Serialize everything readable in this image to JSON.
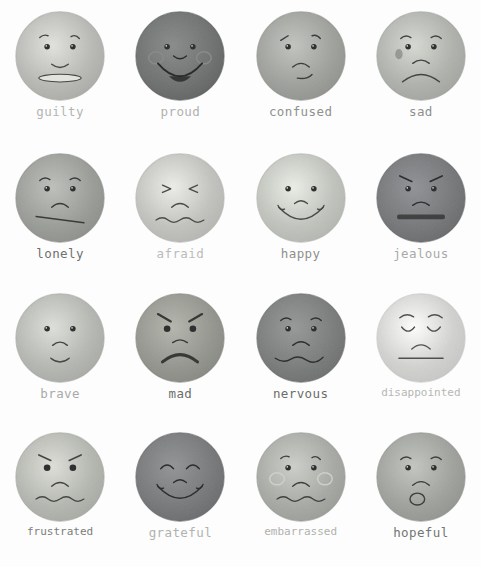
{
  "page": {
    "background": "#fdfdfd",
    "columns": 4,
    "rows": 4,
    "label_font_style": "typewriter",
    "palette_note": "grayscale watercolor washes"
  },
  "faces": [
    {
      "label": "guilty",
      "row": 1,
      "col": 1,
      "fill": "#b9bab6",
      "fill_edge": "#a7a8a4",
      "label_color": "#b4b5b2",
      "eyes": "open-dot",
      "brows": "one-raised-left",
      "mouth": "flat-oval-grimace",
      "cheeks": "none"
    },
    {
      "label": "proud",
      "row": 1,
      "col": 2,
      "fill": "#6f7271",
      "fill_edge": "#5d605f",
      "label_color": "#b0b1af",
      "eyes": "open-dot",
      "brows": "none",
      "mouth": "big-open-smile",
      "cheeks": "two-circles"
    },
    {
      "label": "confused",
      "row": 1,
      "col": 3,
      "fill": "#9fa19d",
      "fill_edge": "#8d8f8b",
      "label_color": "#8f918e",
      "eyes": "open-dot",
      "brows": "two-slanted",
      "mouth": "small-frown-offset",
      "cheeks": "none"
    },
    {
      "label": "sad",
      "row": 1,
      "col": 4,
      "fill": "#b0b2ad",
      "fill_edge": "#9fa19c",
      "label_color": "#8d8f8c",
      "eyes": "open-dot",
      "brows": "two-worried",
      "mouth": "big-frown",
      "cheeks": "left-tear-blotch"
    },
    {
      "label": "lonely",
      "row": 2,
      "col": 1,
      "fill": "#9b9d99",
      "fill_edge": "#8a8c88",
      "label_color": "#6e706d",
      "eyes": "open-dot",
      "brows": "two-worried",
      "mouth": "straight-slanted-line",
      "cheeks": "small-frown-above"
    },
    {
      "label": "afraid",
      "row": 2,
      "col": 2,
      "fill": "#c2c3bf",
      "fill_edge": "#b2b3af",
      "label_color": "#bbbcb9",
      "eyes": "squeezed-shut",
      "brows": "none",
      "mouth": "wavy-line-with-frown",
      "cheeks": "none"
    },
    {
      "label": "happy",
      "row": 2,
      "col": 3,
      "fill": "#c1c3bd",
      "fill_edge": "#b1b3ae",
      "label_color": "#8e908d",
      "eyes": "open-dot",
      "brows": "none",
      "mouth": "wide-smile-with-nose",
      "cheeks": "none"
    },
    {
      "label": "jealous",
      "row": 2,
      "col": 4,
      "fill": "#76787a",
      "fill_edge": "#656769",
      "label_color": "#a9aaa8",
      "eyes": "open-dot",
      "brows": "two-angry",
      "mouth": "flat-thick-bar",
      "cheeks": "small-frown-above"
    },
    {
      "label": "brave",
      "row": 3,
      "col": 1,
      "fill": "#b6b8b3",
      "fill_edge": "#a5a7a2",
      "label_color": "#a9aaa7",
      "eyes": "open-dot",
      "brows": "none",
      "mouth": "small-smile-with-nose",
      "cheeks": "none"
    },
    {
      "label": "mad",
      "row": 3,
      "col": 2,
      "fill": "#94968f",
      "fill_edge": "#83857f",
      "label_color": "#6c6e6b",
      "eyes": "big-dot",
      "brows": "two-angry-thick",
      "mouth": "thick-frown",
      "cheeks": "none"
    },
    {
      "label": "nervous",
      "row": 3,
      "col": 3,
      "fill": "#7b7d7c",
      "fill_edge": "#6a6c6b",
      "label_color": "#6b6d6a",
      "eyes": "open-dot",
      "brows": "two-worried",
      "mouth": "wavy-line",
      "cheeks": "small-frown-above"
    },
    {
      "label": "disappointed",
      "row": 3,
      "col": 4,
      "fill": "#d2d3d0",
      "fill_edge": "#c4c5c2",
      "label_color": "#b6b7b4",
      "eyes": "closed-downcast",
      "brows": "two-high-arcs",
      "mouth": "flat-line-with-frown",
      "cheeks": "none"
    },
    {
      "label": "frustrated",
      "row": 4,
      "col": 1,
      "fill": "#b5b7b1",
      "fill_edge": "#a4a6a0",
      "label_color": "#7b7d7a",
      "eyes": "big-dot",
      "brows": "two-angry",
      "mouth": "wavy-line-with-frown",
      "cheeks": "none"
    },
    {
      "label": "grateful",
      "row": 4,
      "col": 2,
      "fill": "#78797a",
      "fill_edge": "#67686a",
      "label_color": "#b1b2b0",
      "eyes": "closed-happy",
      "brows": "none",
      "mouth": "wide-smile-with-nose",
      "cheeks": "none"
    },
    {
      "label": "embarrassed",
      "row": 4,
      "col": 3,
      "fill": "#a8aaa5",
      "fill_edge": "#979994",
      "label_color": "#b0b1ae",
      "eyes": "open-dot",
      "brows": "one-raised-left",
      "mouth": "wavy-line-with-frown",
      "cheeks": "two-circles"
    },
    {
      "label": "hopeful",
      "row": 4,
      "col": 4,
      "fill": "#a0a29d",
      "fill_edge": "#8f918c",
      "label_color": "#737572",
      "eyes": "open-dot",
      "brows": "two-worried",
      "mouth": "small-frown-with-o",
      "cheeks": "none"
    }
  ]
}
